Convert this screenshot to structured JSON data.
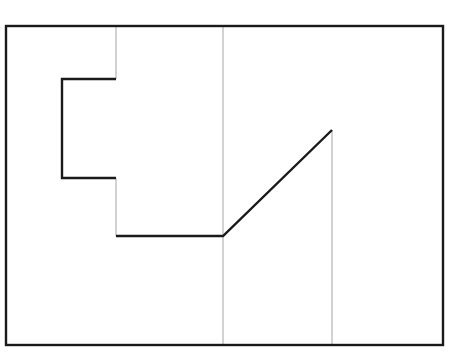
{
  "diagram": {
    "canvas": {
      "width": 450,
      "height": 355,
      "background": "#ffffff"
    },
    "colors": {
      "frame": "#1a1a1a",
      "path": "#1a1a1a",
      "guide": "#b5b5b5"
    },
    "frame": {
      "x": 6,
      "y": 26,
      "width": 437,
      "height": 319
    },
    "guides": [
      {
        "x1": 116,
        "y1": 26,
        "x2": 116,
        "y2": 79
      },
      {
        "x1": 116,
        "y1": 178,
        "x2": 116,
        "y2": 236
      },
      {
        "x1": 223,
        "y1": 26,
        "x2": 223,
        "y2": 345
      },
      {
        "x1": 332,
        "y1": 130,
        "x2": 332,
        "y2": 345
      }
    ],
    "path_points": "116,79 62,79 62,178 116,178",
    "path2_points": "116,236 223,236 332,130"
  }
}
